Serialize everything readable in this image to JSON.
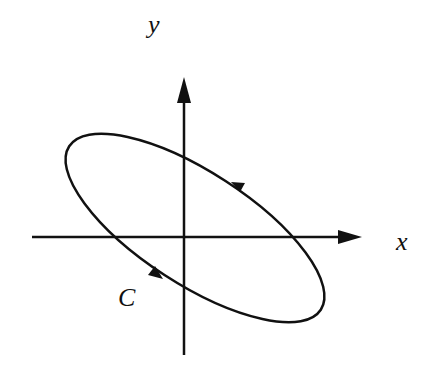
{
  "diagram": {
    "labels": {
      "y_axis": "y",
      "x_axis": "x",
      "curve": "C"
    },
    "colors": {
      "stroke": "#111111",
      "background": "#ffffff"
    },
    "curve_orientation": "counterclockwise"
  }
}
